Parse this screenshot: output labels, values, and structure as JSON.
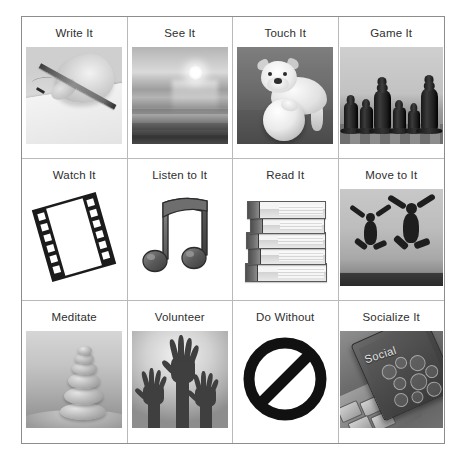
{
  "page": {
    "background_color": "#ffffff",
    "border_color": "#8d8d8d",
    "divider_color": "#b9b9b9",
    "label_color": "#2f2f2f"
  },
  "grid": {
    "rows": 3,
    "columns": 4,
    "cells": [
      {
        "label": "Write It",
        "icon": "writing-hand-photo",
        "art": "write"
      },
      {
        "label": "See It",
        "icon": "sunset-ocean-photo",
        "art": "see"
      },
      {
        "label": "Touch It",
        "icon": "bulldog-with-ball-photo",
        "art": "touch"
      },
      {
        "label": "Game It",
        "icon": "chess-pieces-photo",
        "art": "game"
      },
      {
        "label": "Watch It",
        "icon": "film-strip-icon",
        "art": "watch"
      },
      {
        "label": "Listen to It",
        "icon": "music-note-icon",
        "art": "listen"
      },
      {
        "label": "Read It",
        "icon": "stack-of-books-photo",
        "art": "read"
      },
      {
        "label": "Move to It",
        "icon": "jumping-people-photo",
        "art": "move"
      },
      {
        "label": "Meditate",
        "icon": "stacked-stones-photo",
        "art": "meditate"
      },
      {
        "label": "Volunteer",
        "icon": "raised-hands-photo",
        "art": "volunteer"
      },
      {
        "label": "Do Without",
        "icon": "prohibition-sign-icon",
        "art": "nosign"
      },
      {
        "label": "Socialize It",
        "icon": "phone-social-photo",
        "art": "social"
      }
    ]
  },
  "artwork_text": {
    "social_label": "Social"
  }
}
